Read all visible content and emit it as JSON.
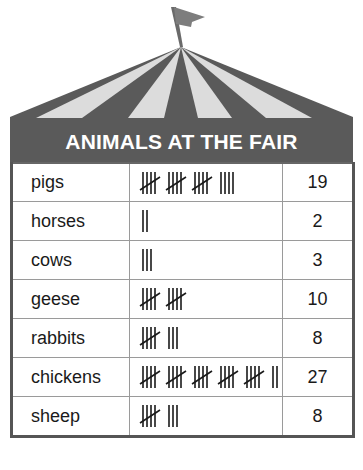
{
  "title": "ANIMALS AT THE FAIR",
  "colors": {
    "tent_dark": "#5a5a5a",
    "tent_light": "#dcdcdc",
    "flag": "#7d7d7d",
    "text": "#1a1a1a"
  },
  "rows": [
    {
      "animal": "pigs",
      "tally": 19,
      "count": "19"
    },
    {
      "animal": "horses",
      "tally": 2,
      "count": "2"
    },
    {
      "animal": "cows",
      "tally": 3,
      "count": "3"
    },
    {
      "animal": "geese",
      "tally": 10,
      "count": "10"
    },
    {
      "animal": "rabbits",
      "tally": 8,
      "count": "8"
    },
    {
      "animal": "chickens",
      "tally": 27,
      "count": "27"
    },
    {
      "animal": "sheep",
      "tally": 8,
      "count": "8"
    }
  ],
  "chart_data": {
    "type": "table",
    "title": "ANIMALS AT THE FAIR",
    "columns": [
      "Animal",
      "Tally",
      "Number"
    ],
    "categories": [
      "pigs",
      "horses",
      "cows",
      "geese",
      "rabbits",
      "chickens",
      "sheep"
    ],
    "values": [
      19,
      2,
      3,
      10,
      8,
      27,
      8
    ]
  }
}
